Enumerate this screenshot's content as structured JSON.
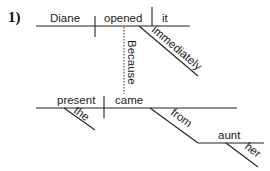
{
  "diagram": {
    "number_label": "1)",
    "type": "sentence-diagram",
    "main_clause": {
      "subject": "Diane",
      "verb": "opened",
      "object": "it",
      "modifiers": [
        {
          "word": "immediately",
          "modifies": "opened"
        }
      ]
    },
    "connector": {
      "word": "Because",
      "style": "dotted"
    },
    "subordinate_clause": {
      "subject": "present",
      "verb": "came",
      "modifiers": [
        {
          "word": "the",
          "modifies": "present"
        },
        {
          "word": "from",
          "modifies": "came",
          "object": "aunt"
        },
        {
          "word": "her",
          "modifies": "aunt"
        }
      ]
    },
    "labels": {
      "diane": "Diane",
      "opened": "opened",
      "it": "it",
      "immediately": "immediately",
      "because": "Because",
      "present": "present",
      "came": "came",
      "the": "the",
      "from": "from",
      "aunt": "aunt",
      "her": "her"
    },
    "colors": {
      "line": "#222222",
      "text": "#222222",
      "background": "#ffffff"
    }
  }
}
